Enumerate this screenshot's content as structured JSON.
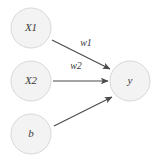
{
  "diagram": {
    "background_color": "#ffffff",
    "node_fill_color": "#f3f3f3",
    "node_stroke_color": "#d8d8d8",
    "edge_color": "#4a4a4a",
    "text_color": "#3a3a3a"
  },
  "nodes": [
    {
      "id": "x1",
      "label": "X1",
      "cx": 31,
      "cy": 28,
      "r": 20,
      "role": "input"
    },
    {
      "id": "x2",
      "label": "X2",
      "cx": 31,
      "cy": 81,
      "r": 20,
      "role": "input"
    },
    {
      "id": "b",
      "label": "b",
      "cx": 31,
      "cy": 134,
      "r": 20,
      "role": "bias"
    },
    {
      "id": "y",
      "label": "y",
      "cx": 130,
      "cy": 81,
      "r": 20,
      "role": "output"
    }
  ],
  "edges": [
    {
      "id": "e-x1-y",
      "from": "x1",
      "to": "y",
      "label": "w1",
      "x1": 52,
      "y1": 40,
      "x2": 110,
      "y2": 69,
      "label_x": 86,
      "label_y": 44
    },
    {
      "id": "e-x2-y",
      "from": "x2",
      "to": "y",
      "label": "w2",
      "x1": 53,
      "y1": 81,
      "x2": 108,
      "y2": 81,
      "label_x": 76,
      "label_y": 67
    },
    {
      "id": "e-b-y",
      "from": "b",
      "to": "y",
      "label": "",
      "x1": 54,
      "y1": 126,
      "x2": 112,
      "y2": 97,
      "label_x": 0,
      "label_y": 0
    }
  ]
}
